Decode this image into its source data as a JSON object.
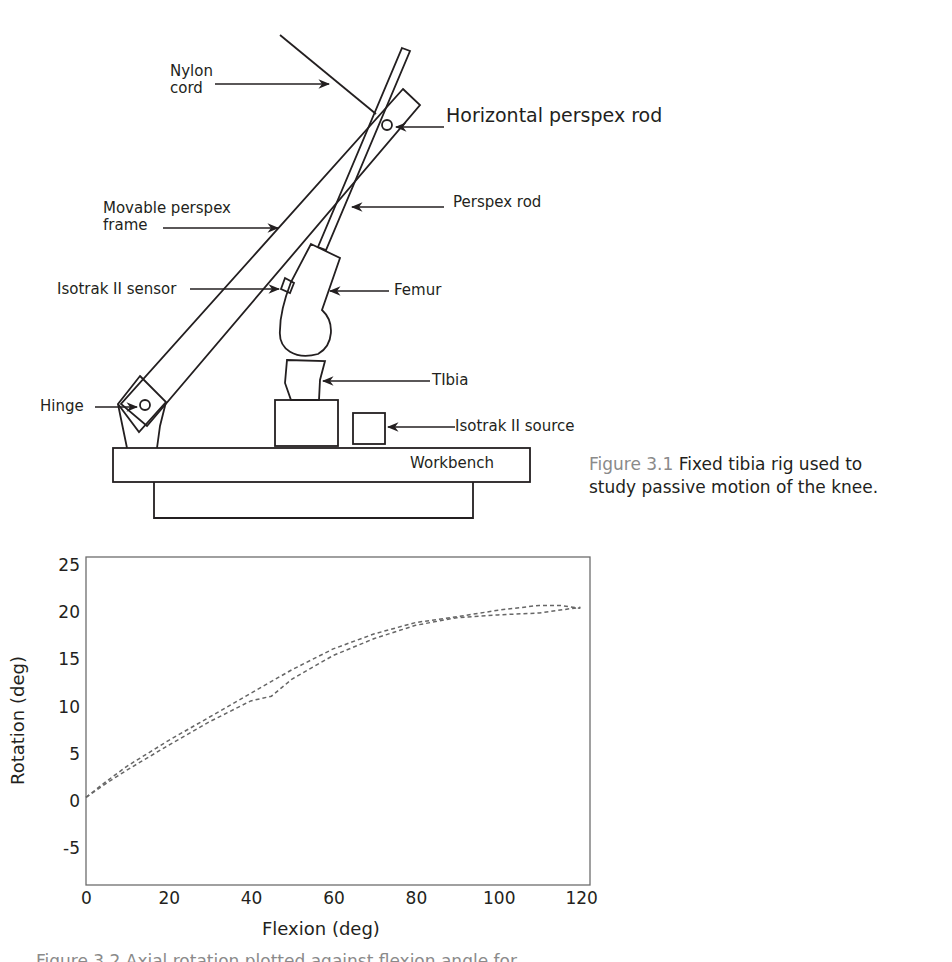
{
  "figure_1": {
    "labels": {
      "nylon_cord": [
        "Nylon",
        "cord"
      ],
      "horizontal_perspex_rod": "Horizontal perspex rod",
      "perspex_rod": "Perspex rod",
      "movable_perspex_frame": [
        "Movable perspex",
        "frame"
      ],
      "isotrak_sensor": "Isotrak II sensor",
      "femur": "Femur",
      "tibia": "TIbia",
      "hinge": "Hinge",
      "isotrak_source": "Isotrak II source",
      "workbench": "Workbench"
    },
    "caption": {
      "number": "Figure 3.1",
      "text_line1": "Fixed tibia rig used to",
      "text_line2": "study passive motion of the knee."
    }
  },
  "figure_2": {
    "bottom_caption_clipped": "Figure 3.2 Axial rotation plotted against flexion angle for ..."
  },
  "chart_data": {
    "type": "line",
    "title": "",
    "xlabel": "Flexion (deg)",
    "ylabel": "Rotation (deg)",
    "xlim": [
      0,
      122
    ],
    "ylim": [
      -8,
      25
    ],
    "x_ticks": [
      "0",
      "20",
      "40",
      "60",
      "80",
      "100",
      "120"
    ],
    "y_ticks": [
      "25",
      "20",
      "15",
      "10",
      "5",
      "0",
      "-5"
    ],
    "grid": false,
    "legend": null,
    "line_style": "dashed",
    "series": [
      {
        "name": "upper trace",
        "x": [
          0,
          5,
          10,
          20,
          30,
          40,
          50,
          60,
          70,
          80,
          90,
          100,
          110,
          115,
          120
        ],
        "y": [
          0.5,
          2.2,
          3.8,
          6.5,
          9.0,
          11.5,
          14.0,
          16.2,
          17.8,
          19.0,
          19.6,
          20.3,
          20.8,
          20.8,
          20.5
        ]
      },
      {
        "name": "lower trace",
        "x": [
          0,
          5,
          10,
          20,
          30,
          40,
          45,
          50,
          60,
          70,
          80,
          90,
          100,
          110,
          120
        ],
        "y": [
          0.5,
          2.0,
          3.4,
          6.0,
          8.5,
          10.7,
          11.2,
          13.0,
          15.5,
          17.3,
          18.7,
          19.5,
          19.8,
          20.0,
          20.6
        ]
      }
    ]
  }
}
